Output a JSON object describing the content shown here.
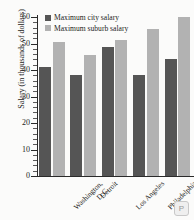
{
  "chart_data": {
    "type": "bar",
    "title": "",
    "xlabel": "",
    "ylabel": "Salary (in thousands of dollars)",
    "ylim": [
      0,
      60
    ],
    "ytick_step": 10,
    "yticks": [
      0,
      10,
      20,
      30,
      40,
      50,
      60
    ],
    "minor_ticks": true,
    "grid": false,
    "legend_position": "top-left",
    "categories": [
      "Washington, D.C.",
      "Detroit",
      "Los Angeles",
      "Philadelphia",
      "New York"
    ],
    "category_lines": [
      [
        "Washington,",
        "D.C."
      ],
      [
        "Detroit",
        ""
      ],
      [
        "Los Angeles",
        ""
      ],
      [
        "Philadelphia",
        ""
      ],
      [
        "New York",
        ""
      ]
    ],
    "series": [
      {
        "name": "Maximum city salary",
        "color": "#555555",
        "values": [
          41,
          38,
          48.8,
          38,
          44
        ]
      },
      {
        "name": "Maximum suburb salary",
        "color": "#b2b2b2",
        "values": [
          50.5,
          45.7,
          51.5,
          55.6,
          60
        ]
      }
    ]
  },
  "legend": {
    "items": [
      {
        "label": "Maximum city salary"
      },
      {
        "label": "Maximum suburb salary"
      }
    ]
  },
  "corner": {
    "badge_label": "P"
  }
}
